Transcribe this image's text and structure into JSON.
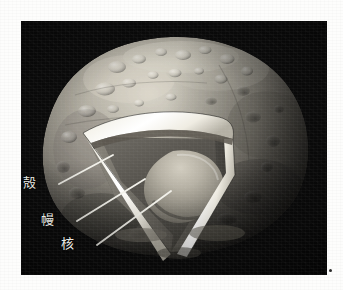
{
  "figure": {
    "kind": "asteroid-cutaway-diagram",
    "background_color": "#0b0b0b",
    "page_background_color": "#fdfdfc"
  },
  "labels": {
    "crust": "殻",
    "mantle": "幔",
    "core": "核"
  },
  "layers": [
    {
      "name": "crust",
      "label": "殻",
      "color": "#e6e4dc",
      "note": "bright thin outer rim of the cutaway"
    },
    {
      "name": "mantle",
      "label": "幔",
      "color": "#56544e",
      "note": "dark interior shell between crust and core"
    },
    {
      "name": "core",
      "label": "核",
      "color": "#b9b4a8",
      "note": "lighter rounded triangular central body"
    }
  ],
  "surface": {
    "body_color": "#9e9a90",
    "shadow_color": "#3a3833",
    "highlight_color": "#d6d2c6",
    "crater_count_visible": 26
  },
  "leader_lines": {
    "color": "#f2f1ea",
    "count": 3
  }
}
